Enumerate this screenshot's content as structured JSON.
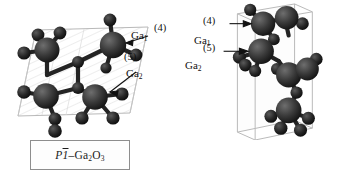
{
  "figure": {
    "type": "crystal-structure-comparison",
    "material": "Ga2O3",
    "background_color": "#ffffff",
    "atom_colors": {
      "gallium": "#2b2b2b",
      "oxygen": "#1c1c1c",
      "bond": "#222222",
      "cell_edge": "#b9b9b9"
    }
  },
  "panels": [
    {
      "id": "left",
      "phase_label": {
        "spacegroup_italic": "P",
        "spacegroup_number": "1",
        "overline": true,
        "dash": "–",
        "formula": "Ga",
        "sub1": "2",
        "formula2": "O",
        "sub2": "3",
        "full_text": "P1̄–Ga2O3"
      },
      "cell_type": "triclinic-parallelogram",
      "annotations": [
        {
          "name": "ga1",
          "label": "Ga",
          "sub": "1",
          "coordination": "(4)",
          "x": 131,
          "y": 36,
          "num_x": 155,
          "num_y": 29
        },
        {
          "name": "ga2",
          "label": "Ga",
          "sub": "2",
          "coordination": "(5)",
          "x": 126,
          "y": 73,
          "num_x": 124,
          "num_y": 57
        }
      ]
    },
    {
      "id": "right",
      "phase_label": {
        "spacegroup_italic": "Pmc",
        "spacegroup_number": "2",
        "spacegroup_sub": "1",
        "overline": false,
        "dash": "–",
        "formula": "Ga",
        "sub1": "2",
        "formula2": "O",
        "sub2": "3",
        "full_text": "Pmc21–Ga2O3"
      },
      "cell_type": "orthorhombic-box",
      "annotations": [
        {
          "name": "ga1",
          "label": "Ga",
          "sub": "1",
          "coordination": "(4)",
          "x": 17,
          "y": 40,
          "num_x": 26,
          "num_y": 21
        },
        {
          "name": "ga2",
          "label": "Ga",
          "sub": "2",
          "coordination": "(5)",
          "x": 8,
          "y": 64,
          "num_x": 26,
          "num_y": 48
        }
      ]
    }
  ]
}
